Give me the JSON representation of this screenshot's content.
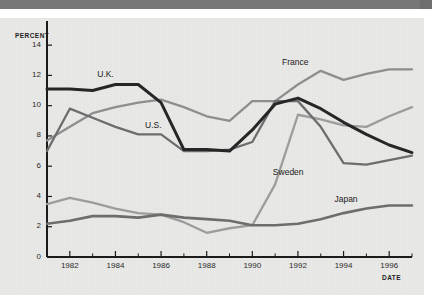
{
  "figure": {
    "background_color": "#e9e9e7",
    "banner_color": "#6e6e6e"
  },
  "axis_titles": {
    "y": "PERCENT",
    "x": "DATE"
  },
  "chart_data": {
    "type": "line",
    "title": "",
    "subtitle": "",
    "xlabel": "DATE",
    "ylabel": "PERCENT",
    "xlim": [
      1981,
      1997
    ],
    "ylim": [
      0,
      15
    ],
    "grid": false,
    "legend_position": "inline-annotations",
    "x": [
      1981,
      1982,
      1983,
      1984,
      1985,
      1986,
      1987,
      1988,
      1989,
      1990,
      1991,
      1992,
      1993,
      1994,
      1995,
      1996,
      1997
    ],
    "y_ticks": [
      0,
      2,
      4,
      6,
      8,
      10,
      12,
      14
    ],
    "y_tick_labels": [
      "0",
      "2",
      "4",
      "6",
      "8",
      "10",
      "12",
      "14"
    ],
    "x_ticks": [
      1982,
      1984,
      1986,
      1988,
      1990,
      1992,
      1994,
      1996
    ],
    "x_tick_labels": [
      "1982",
      "1984",
      "1986",
      "1988",
      "1990",
      "1992",
      "1994",
      "1996"
    ],
    "x_minor_ticks": [
      1981,
      1983,
      1985,
      1987,
      1989,
      1991,
      1993,
      1995,
      1997
    ],
    "series": [
      {
        "name": "U.K.",
        "color": "#262626",
        "width": 3.0,
        "label_x": 1983.2,
        "label_y": 12.1,
        "values": [
          11.1,
          11.1,
          11.0,
          11.4,
          11.4,
          10.2,
          7.1,
          7.1,
          7.0,
          8.4,
          10.1,
          10.5,
          9.8,
          8.9,
          8.1,
          7.4,
          6.9
        ]
      },
      {
        "name": "U.S.",
        "color": "#6d6d6d",
        "width": 2.3,
        "label_x": 1985.3,
        "label_y": 8.7,
        "values": [
          7.0,
          9.8,
          9.2,
          8.6,
          8.1,
          8.1,
          7.0,
          7.0,
          7.1,
          7.6,
          10.3,
          10.3,
          8.6,
          6.2,
          6.1,
          6.4,
          6.7
        ]
      },
      {
        "name": "France",
        "color": "#8e8e8e",
        "width": 2.3,
        "label_x": 1991.3,
        "label_y": 12.9,
        "values": [
          7.7,
          8.6,
          9.5,
          9.9,
          10.2,
          10.4,
          9.9,
          9.3,
          9.0,
          10.3,
          10.3,
          11.4,
          12.3,
          11.7,
          12.1,
          12.4,
          12.4
        ]
      },
      {
        "name": "Sweden",
        "color": "#9c9c9c",
        "width": 2.3,
        "label_x": 1990.9,
        "label_y": 5.6,
        "values": [
          3.5,
          3.9,
          3.6,
          3.2,
          2.9,
          2.8,
          2.3,
          1.6,
          1.9,
          2.1,
          4.8,
          9.4,
          9.1,
          8.7,
          8.6,
          9.3,
          9.9
        ]
      },
      {
        "name": "Japan",
        "color": "#6d6d6d",
        "width": 2.6,
        "label_x": 1993.6,
        "label_y": 3.8,
        "values": [
          2.2,
          2.4,
          2.7,
          2.7,
          2.6,
          2.8,
          2.6,
          2.5,
          2.4,
          2.1,
          2.1,
          2.2,
          2.5,
          2.9,
          3.2,
          3.4,
          3.4
        ]
      }
    ]
  }
}
